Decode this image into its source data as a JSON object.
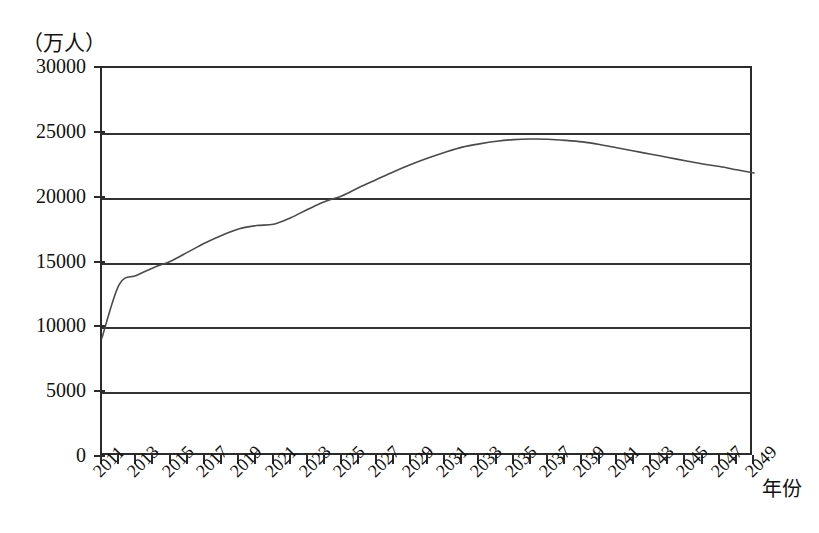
{
  "chart_data": {
    "type": "line",
    "title": "",
    "xlabel": "年份",
    "ylabel": "（万人）",
    "ylim": [
      0,
      30000
    ],
    "xlim": [
      2011,
      2049
    ],
    "grid": true,
    "legend": "none",
    "y_ticks": [
      "0",
      "5000",
      "10000",
      "15000",
      "20000",
      "25000",
      "30000"
    ],
    "y_tick_values": [
      0,
      5000,
      10000,
      15000,
      20000,
      25000,
      30000
    ],
    "x_tick_labels": [
      "2011",
      "2013",
      "2015",
      "2017",
      "2019",
      "2021",
      "2023",
      "2025",
      "2027",
      "2029",
      "2031",
      "2033",
      "2035",
      "2037",
      "2039",
      "2041",
      "2043",
      "2045",
      "2047",
      "2049"
    ],
    "x_minor_tick_years": [
      2011,
      2012,
      2013,
      2014,
      2015,
      2016,
      2017,
      2018,
      2019,
      2020,
      2021,
      2022,
      2023,
      2024,
      2025,
      2026,
      2027,
      2028,
      2029,
      2030,
      2031,
      2032,
      2033,
      2034,
      2035,
      2036,
      2037,
      2038,
      2039,
      2040,
      2041,
      2042,
      2043,
      2044,
      2045,
      2046,
      2047,
      2048,
      2049
    ],
    "series": [
      {
        "name": "人口",
        "x": [
          2011,
          2012,
          2013,
          2014,
          2015,
          2016,
          2017,
          2018,
          2019,
          2020,
          2021,
          2022,
          2023,
          2024,
          2025,
          2026,
          2027,
          2028,
          2029,
          2030,
          2031,
          2032,
          2033,
          2034,
          2035,
          2036,
          2037,
          2038,
          2039,
          2040,
          2041,
          2042,
          2043,
          2044,
          2045,
          2046,
          2047,
          2048,
          2049
        ],
        "values": [
          9200,
          13300,
          14000,
          14600,
          15100,
          15800,
          16500,
          17100,
          17600,
          17850,
          17950,
          18450,
          19100,
          19700,
          20150,
          20800,
          21400,
          22000,
          22550,
          23050,
          23500,
          23900,
          24150,
          24350,
          24480,
          24520,
          24500,
          24420,
          24300,
          24100,
          23850,
          23600,
          23350,
          23100,
          22850,
          22600,
          22400,
          22150,
          21900
        ]
      }
    ]
  }
}
